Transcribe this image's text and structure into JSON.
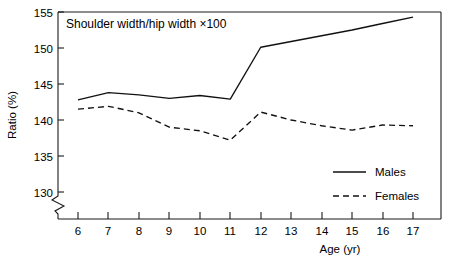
{
  "chart_data": {
    "type": "line",
    "title": "Shoulder width/hip width ×100",
    "xlabel": "Age (yr)",
    "ylabel": "Ratio (%)",
    "x": [
      6,
      7,
      8,
      9,
      10,
      11,
      12,
      13,
      14,
      15,
      16,
      17
    ],
    "xtick_labels": [
      "6",
      "7",
      "8",
      "9",
      "10",
      "11",
      "12",
      "13",
      "14",
      "15",
      "16",
      "17"
    ],
    "ytick_labels": [
      "130",
      "135",
      "140",
      "145",
      "150",
      "155"
    ],
    "yticks": [
      130,
      135,
      140,
      145,
      150,
      155
    ],
    "ylim": [
      128.5,
      155
    ],
    "xlim": [
      5.3,
      17.0
    ],
    "y_axis_break": true,
    "y_axis_break_note": "axis break below 130",
    "grid": false,
    "legend_position": "lower right",
    "series": [
      {
        "name": "Males",
        "style": "solid",
        "values": [
          142.8,
          143.8,
          143.5,
          143.0,
          143.4,
          142.9,
          150.1,
          150.9,
          151.7,
          152.5,
          153.4,
          154.3
        ]
      },
      {
        "name": "Females",
        "style": "dashed",
        "values": [
          141.5,
          141.9,
          141.0,
          139.0,
          138.5,
          137.2,
          141.1,
          140.0,
          139.2,
          138.6,
          139.3,
          139.2
        ]
      }
    ],
    "legend": [
      {
        "label": "Males",
        "style": "solid"
      },
      {
        "label": "Females",
        "style": "dashed"
      }
    ]
  }
}
